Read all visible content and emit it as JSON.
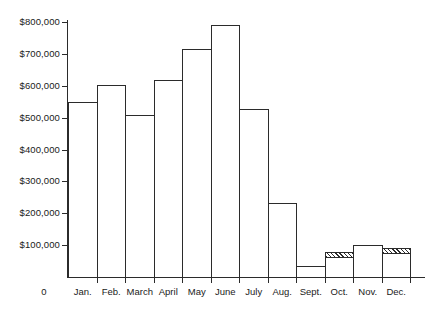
{
  "chart_data": {
    "type": "bar",
    "title": "",
    "xlabel": "",
    "ylabel": "",
    "origin_label": "0",
    "categories": [
      "Jan.",
      "Feb.",
      "March",
      "April",
      "May",
      "June",
      "July",
      "Aug.",
      "Sept.",
      "Oct.",
      "Nov.",
      "Dec."
    ],
    "values": [
      548000,
      602000,
      508000,
      617000,
      715000,
      790000,
      527000,
      231000,
      35000,
      80000,
      100000,
      90000
    ],
    "bar_styles": [
      "plain",
      "plain",
      "plain",
      "plain",
      "plain",
      "plain",
      "plain",
      "plain",
      "plain",
      "hatched-top",
      "plain",
      "hatched-top"
    ],
    "ylim": [
      0,
      800000
    ],
    "ytick_values": [
      100000,
      200000,
      300000,
      400000,
      500000,
      600000,
      700000,
      800000
    ],
    "ytick_labels": [
      "$100,000",
      "$200,000",
      "$300,000",
      "$400,000",
      "$500,000",
      "$600,000",
      "$700,000",
      "$800,000"
    ],
    "grid": false,
    "legend": "none",
    "bar_fill_color": "#ffffff",
    "bar_border_color": "#2b2b2b",
    "axis_color": "#2b2b2b",
    "background_color": "#ffffff"
  }
}
